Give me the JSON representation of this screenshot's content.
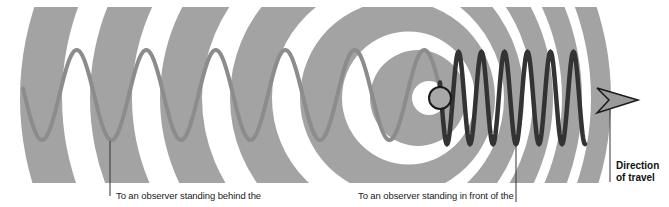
{
  "diagram": {
    "colors": {
      "background": "#ffffff",
      "band": "#a3a3a3",
      "wave_behind": "#8c8c8c",
      "wave_front": "#333333",
      "source_fill": "#a8a8a8",
      "source_stroke": "#1a1a1a",
      "arrow_fill": "#9a9a9a",
      "leader_line": "#333333"
    },
    "source": {
      "cx": 440,
      "cy": 98,
      "r": 11
    },
    "clip": {
      "top": 7,
      "bottom": 183
    },
    "rings": [
      {
        "outer_cx": 418,
        "outer_r": 48,
        "inner_cx": 429,
        "inner_r": 17
      },
      {
        "outer_cx": 397.5,
        "outer_r": 97.5,
        "inner_cx": 408.5,
        "inner_r": 66.5
      },
      {
        "outer_cx": 377,
        "outer_r": 147,
        "inner_cx": 388,
        "inner_r": 116
      },
      {
        "outer_cx": 356.5,
        "outer_r": 196.5,
        "inner_cx": 367.5,
        "inner_r": 165.5
      },
      {
        "outer_cx": 336,
        "outer_r": 246,
        "inner_cx": 347,
        "inner_r": 215
      },
      {
        "outer_cx": 315.5,
        "outer_r": 295.5,
        "inner_cx": 326.5,
        "inner_r": 264.5
      }
    ],
    "wave_behind": {
      "x_start": 23,
      "x_end": 440,
      "period": 69.5,
      "amplitude": 45,
      "center_y": 95,
      "first_trough_x": 42
    },
    "wave_front": {
      "x_start": 440,
      "x_end": 585,
      "period": 23,
      "amplitude": 46,
      "center_y": 98,
      "first_trough_x": 447
    },
    "arrow": {
      "points": "597,88 638,100 597,113 609,100"
    },
    "labels": {
      "behind": "To an observer standing behind the",
      "front": "To an observer standing in front of the",
      "direction_line1": "Direction",
      "direction_line2": "of travel"
    },
    "leaders": {
      "behind": {
        "x": 110,
        "y1": 141,
        "y2": 196
      },
      "front": {
        "x": 516,
        "y1": 146,
        "y2": 202
      },
      "direction": {
        "x": 610,
        "y1": 108,
        "y2": 182
      }
    }
  }
}
